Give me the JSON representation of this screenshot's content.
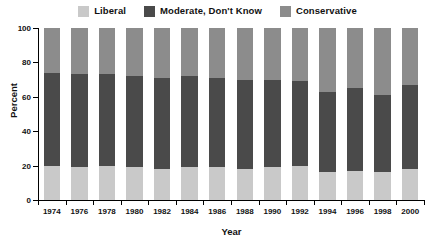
{
  "chart_data": {
    "type": "bar",
    "subtype": "stacked-bar-100-percent",
    "title": "",
    "xlabel": "Year",
    "ylabel": "Percent",
    "ylim": [
      0,
      100
    ],
    "yticks": [
      0,
      20,
      40,
      60,
      80,
      100
    ],
    "grid": false,
    "legend_position": "top-center",
    "categories": [
      "1974",
      "1976",
      "1978",
      "1980",
      "1982",
      "1984",
      "1986",
      "1988",
      "1990",
      "1992",
      "1994",
      "1996",
      "1998",
      "2000"
    ],
    "series": [
      {
        "name": "Liberal",
        "color": "#c9c9c9",
        "values": [
          20,
          19,
          20,
          19,
          18,
          19,
          19,
          18,
          19,
          20,
          16,
          17,
          16,
          18
        ]
      },
      {
        "name": "Moderate, Don't Know",
        "color": "#4a4a4a",
        "values": [
          54,
          54,
          53,
          53,
          53,
          53,
          52,
          52,
          51,
          49,
          47,
          48,
          45,
          49
        ]
      },
      {
        "name": "Conservative",
        "color": "#8c8c8c",
        "values": [
          26,
          27,
          27,
          28,
          29,
          28,
          29,
          30,
          30,
          31,
          37,
          35,
          39,
          33
        ]
      }
    ]
  },
  "legend": {
    "items": [
      {
        "label": "Liberal",
        "color": "#c9c9c9"
      },
      {
        "label": "Moderate, Don't Know",
        "color": "#4a4a4a"
      },
      {
        "label": "Conservative",
        "color": "#8c8c8c"
      }
    ]
  },
  "axes": {
    "y_title": "Percent",
    "x_title": "Year",
    "y_tick_labels": [
      "100",
      "80",
      "60",
      "40",
      "20",
      "0"
    ],
    "x_tick_labels": [
      "1974",
      "1976",
      "1978",
      "1980",
      "1982",
      "1984",
      "1986",
      "1988",
      "1990",
      "1992",
      "1994",
      "1996",
      "1998",
      "2000"
    ]
  }
}
